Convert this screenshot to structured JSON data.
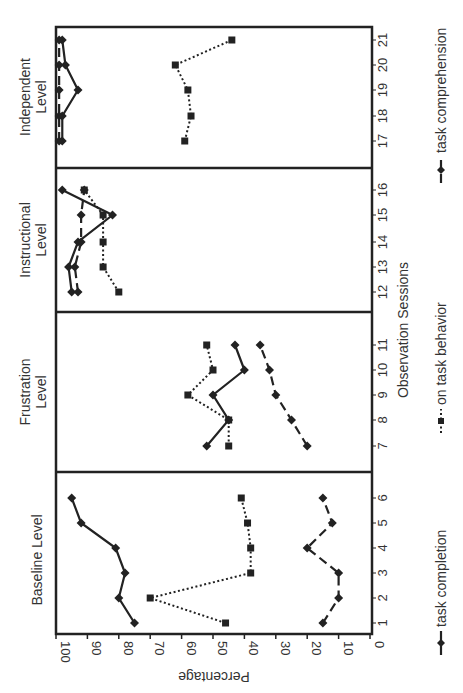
{
  "chart_data": {
    "type": "line",
    "orientation": "rotated-90-ccw",
    "title": "",
    "xlabel": "Observation Sessions",
    "ylabel": "Percentage",
    "ylim": [
      0,
      100
    ],
    "yticks": [
      0,
      10,
      20,
      30,
      40,
      50,
      60,
      70,
      80,
      90,
      100
    ],
    "grid": false,
    "legend_position": "bottom",
    "phases": [
      {
        "name": "Baseline Level",
        "label_lines": [
          "Baseline Level"
        ],
        "sessions": [
          1,
          2,
          3,
          4,
          5,
          6
        ]
      },
      {
        "name": "Frustration Level",
        "label_lines": [
          "Frustration",
          "Level"
        ],
        "sessions": [
          7,
          8,
          9,
          10,
          11
        ]
      },
      {
        "name": "Instructional Level",
        "label_lines": [
          "Instructional",
          "Level"
        ],
        "sessions": [
          12,
          13,
          14,
          15,
          16
        ]
      },
      {
        "name": "Independent Level",
        "label_lines": [
          "Independent",
          "Level"
        ],
        "sessions": [
          17,
          18,
          19,
          20,
          21
        ]
      }
    ],
    "x": [
      1,
      2,
      3,
      4,
      5,
      6,
      7,
      8,
      9,
      10,
      11,
      12,
      13,
      14,
      15,
      16,
      17,
      18,
      19,
      20,
      21
    ],
    "series": [
      {
        "name": "task completion",
        "style": "solid",
        "marker": "diamond",
        "values": [
          75,
          80,
          78,
          81,
          92,
          95,
          52,
          45,
          50,
          40,
          43,
          95,
          96,
          93,
          82,
          98,
          98,
          98,
          93,
          97,
          98
        ]
      },
      {
        "name": "on task behavior",
        "style": "dotted",
        "marker": "square",
        "values": [
          46,
          70,
          38,
          38,
          39,
          41,
          45,
          45,
          58,
          50,
          52,
          80,
          85,
          85,
          85,
          91,
          59,
          57,
          58,
          62,
          44
        ]
      },
      {
        "name": "task comprehension",
        "style": "dashed",
        "marker": "diamond",
        "values": [
          15,
          10,
          10,
          20,
          12,
          15,
          20,
          25,
          30,
          32,
          35,
          93,
          94,
          92,
          92,
          91,
          99,
          99,
          99,
          99,
          99
        ]
      }
    ]
  }
}
